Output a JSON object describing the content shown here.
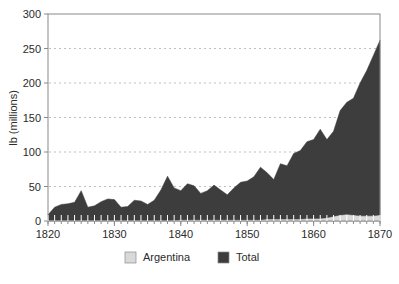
{
  "chart_data": {
    "type": "area",
    "title": "",
    "subtitle": "",
    "xlabel": "",
    "ylabel": "lb (millions)",
    "xlim": [
      1820,
      1870
    ],
    "ylim": [
      0,
      300
    ],
    "yticks": [
      0,
      50,
      100,
      150,
      200,
      250,
      300
    ],
    "ytick_labels": [
      "0",
      "50",
      "100",
      "150",
      "200",
      "250",
      "300"
    ],
    "xticks": [
      1820,
      1830,
      1840,
      1850,
      1860,
      1870
    ],
    "xtick_labels": [
      "1820",
      "1830",
      "1840",
      "1850",
      "1860",
      "1870"
    ],
    "minor_xticks_every": 1,
    "grid": "horizontal-dashed",
    "legend_position": "bottom",
    "x": [
      1820,
      1821,
      1822,
      1823,
      1824,
      1825,
      1826,
      1827,
      1828,
      1829,
      1830,
      1831,
      1832,
      1833,
      1834,
      1835,
      1836,
      1837,
      1838,
      1839,
      1840,
      1841,
      1842,
      1843,
      1844,
      1845,
      1846,
      1847,
      1848,
      1849,
      1850,
      1851,
      1852,
      1853,
      1854,
      1855,
      1856,
      1857,
      1858,
      1859,
      1860,
      1861,
      1862,
      1863,
      1864,
      1865,
      1866,
      1867,
      1868,
      1869,
      1870
    ],
    "series": [
      {
        "name": "Total",
        "color": "#3d3d3d",
        "values": [
          9,
          20,
          24,
          25,
          27,
          44,
          20,
          22,
          28,
          32,
          31,
          20,
          21,
          30,
          29,
          24,
          30,
          45,
          65,
          48,
          44,
          54,
          51,
          40,
          44,
          52,
          45,
          38,
          48,
          56,
          58,
          64,
          78,
          70,
          60,
          83,
          80,
          98,
          102,
          115,
          118,
          133,
          118,
          130,
          160,
          172,
          178,
          200,
          218,
          240,
          262
        ]
      },
      {
        "name": "Argentina",
        "color": "#d9d9d9",
        "values": [
          0,
          0,
          0,
          0,
          0,
          0,
          0,
          0,
          0,
          0,
          0,
          0,
          0,
          0,
          0,
          0,
          0,
          0,
          0,
          0,
          1,
          1,
          1,
          1,
          1,
          1,
          1,
          1,
          1,
          1,
          1,
          1,
          1,
          2,
          2,
          2,
          2,
          2,
          2,
          3,
          3,
          3,
          4,
          6,
          8,
          9,
          8,
          7,
          7,
          7,
          8
        ]
      }
    ],
    "legend": [
      {
        "label": "Argentina",
        "color": "#d9d9d9"
      },
      {
        "label": "Total",
        "color": "#3d3d3d"
      }
    ],
    "geometry": {
      "plot_left": 48,
      "plot_right": 380,
      "plot_top": 14,
      "plot_bottom": 221,
      "frame_color": "#8a8a8a",
      "grid_color": "#bfbfbf"
    }
  }
}
